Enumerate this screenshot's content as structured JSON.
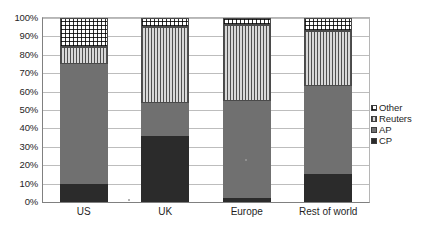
{
  "chart_data": {
    "type": "bar",
    "subtype": "stacked-percentage",
    "title": "",
    "xlabel": "",
    "ylabel": "",
    "ylim": [
      0,
      100
    ],
    "y_tick_labels": [
      "100%",
      "90%",
      "80%",
      "70%",
      "60%",
      "50%",
      "40%",
      "30%",
      "20%",
      "10%",
      "0%"
    ],
    "y_tick_values": [
      100,
      90,
      80,
      70,
      60,
      50,
      40,
      30,
      20,
      10,
      0
    ],
    "grid": true,
    "legend_position": "right",
    "categories": [
      "US",
      "UK",
      "Europe",
      "Rest of world"
    ],
    "series": [
      {
        "name": "CP",
        "pattern": "solid-dark",
        "color": "#2b2b2b",
        "values": [
          10,
          36,
          2,
          15
        ]
      },
      {
        "name": "AP",
        "pattern": "solid-gray",
        "color": "#707070",
        "values": [
          65,
          18,
          53,
          48
        ]
      },
      {
        "name": "Reuters",
        "pattern": "vertical-stripes",
        "color": "#4f4f4f",
        "values": [
          9,
          41,
          41,
          30
        ]
      },
      {
        "name": "Other",
        "pattern": "checkered-grid",
        "color": "#2e2e2e",
        "values": [
          16,
          5,
          4,
          7
        ]
      }
    ],
    "cumulative_tops": {
      "US": {
        "CP": 10,
        "AP": 75,
        "Reuters": 84,
        "Other": 100
      },
      "UK": {
        "CP": 36,
        "AP": 54,
        "Reuters": 95,
        "Other": 100
      },
      "Europe": {
        "CP": 2,
        "AP": 55,
        "Reuters": 96,
        "Other": 100
      },
      "Rest of world": {
        "CP": 15,
        "AP": 63,
        "Reuters": 93,
        "Other": 100
      }
    }
  },
  "legend": {
    "items": [
      {
        "label": "Other"
      },
      {
        "label": "Reuters"
      },
      {
        "label": "AP"
      },
      {
        "label": "CP"
      }
    ]
  },
  "bottom_caption": {
    "text": ""
  }
}
